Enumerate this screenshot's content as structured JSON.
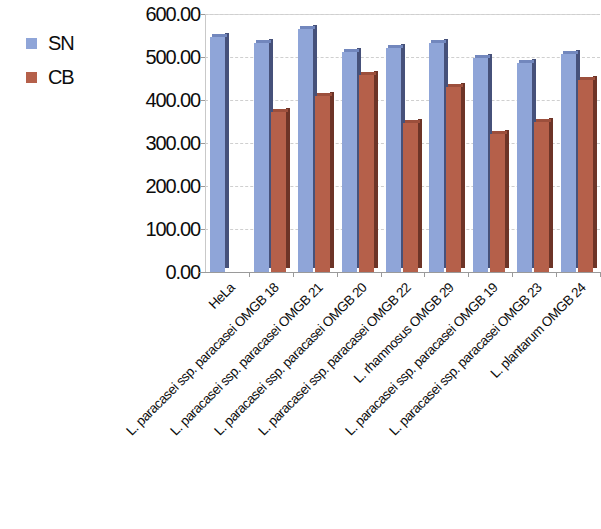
{
  "chart_data": {
    "type": "bar",
    "title": "",
    "xlabel": "",
    "ylabel": "",
    "ylim": [
      0,
      600
    ],
    "ytick_labels": [
      "0.00",
      "100.00",
      "200.00",
      "300.00",
      "400.00",
      "500.00",
      "600.00"
    ],
    "ytick_values": [
      0,
      100,
      200,
      300,
      400,
      500,
      600
    ],
    "grid": true,
    "legend_position": "left",
    "categories": [
      "HeLa",
      "L. paracasei ssp. paracasei OMGB 18",
      "L. paracasei ssp. paracasei OMGB 21",
      "L. paracasei ssp. paracasei OMGB 20",
      "L. paracasei ssp. paracasei OMGB 22",
      "L. rhamnosus OMGB 29",
      "L. paracasei ssp. paracasei OMGB 19",
      "L. paracasei ssp. paracasei OMGB 23",
      "L. plantarum OMGB 24"
    ],
    "series": [
      {
        "name": "SN",
        "color": "#8fa5d8",
        "values": [
          546,
          532,
          565,
          512,
          520,
          533,
          498,
          486,
          508
        ]
      },
      {
        "name": "CB",
        "color": "#b5604a",
        "values": [
          null,
          372,
          410,
          458,
          346,
          430,
          320,
          350,
          447
        ]
      }
    ]
  },
  "legend": {
    "items": [
      {
        "label": "SN",
        "color": "#8fa5d8"
      },
      {
        "label": "CB",
        "color": "#b5604a"
      }
    ]
  }
}
